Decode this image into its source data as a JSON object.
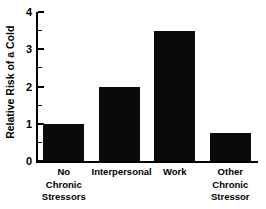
{
  "chart_data": {
    "type": "bar",
    "title": "",
    "subtitle": "",
    "xlabel": "",
    "ylabel": "Relative Risk of a Cold",
    "categories": [
      "No\nChronic\nStressors",
      "Interpersonal",
      "Work",
      "Other\nChronic\nStressor"
    ],
    "values": [
      1.0,
      2.0,
      3.5,
      0.75
    ],
    "ylim": [
      0,
      4
    ],
    "y_ticks": [
      0,
      1,
      2,
      3,
      4
    ],
    "y_tick_labels": [
      "0",
      "1",
      "2",
      "3",
      "4"
    ],
    "y_minor_ticks": [
      0.5,
      1.5,
      2.5,
      3.5
    ],
    "grid": false,
    "legend": false,
    "legend_position": "none",
    "bar_color": "#0a0a0a",
    "axis_color": "#000000",
    "background_color": "#ffffff",
    "annotations": []
  }
}
